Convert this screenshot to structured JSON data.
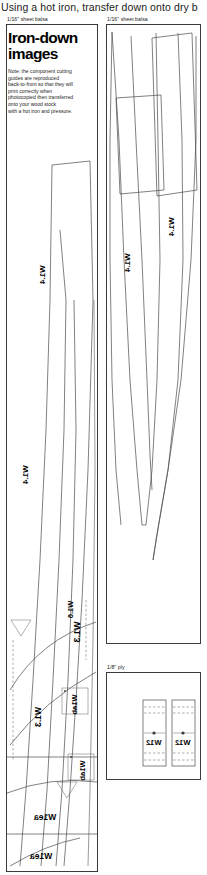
{
  "page": {
    "instruction": "Using a hot iron, transfer down onto dry b",
    "width": 207,
    "height": 875,
    "background": "#ffffff",
    "line_color": "#4a4a4a"
  },
  "title_block": {
    "line1": "Iron-down",
    "line2": "images",
    "note_lines": [
      "Note: the component cutting",
      "guides are reproduced",
      "back-to-front so that they will",
      "print correctly when",
      "photocopied then transferred",
      "onto your wood stock",
      "with a hot iron and pressure."
    ]
  },
  "panels": [
    {
      "id": "panel-left",
      "caption": "1/16\" sheet balsa",
      "material": "1/16\" sheet balsa",
      "x": 6,
      "y": 24,
      "width": 92,
      "height": 848
    },
    {
      "id": "panel-right-top",
      "caption": "1/16\" sheet balsa",
      "material": "1/16\" sheet balsa",
      "x": 106,
      "y": 24,
      "width": 95,
      "height": 620
    },
    {
      "id": "panel-right-bottom",
      "caption": "1/8\" ply",
      "material": "1/8\" ply",
      "x": 106,
      "y": 672,
      "width": 95,
      "height": 108
    }
  ],
  "part_labels": [
    {
      "text": "W1.4",
      "panel": "panel-left",
      "x": 16,
      "y": 470
    },
    {
      "text": "W1.4",
      "panel": "panel-left",
      "x": 33,
      "y": 270
    },
    {
      "text": "W1.6",
      "panel": "panel-left",
      "x": 62,
      "y": 605
    },
    {
      "text": "W1.3",
      "panel": "panel-left",
      "x": 66,
      "y": 619
    },
    {
      "text": "W1.3",
      "panel": "panel-left",
      "x": 32,
      "y": 712
    },
    {
      "text": "W1ea",
      "panel": "panel-left",
      "x": 38,
      "y": 812
    },
    {
      "text": "W1ea",
      "panel": "panel-left",
      "x": 34,
      "y": 851
    },
    {
      "text": "W1ab",
      "panel": "panel-left",
      "x": 70,
      "y": 706
    },
    {
      "text": "W1ab",
      "panel": "panel-left",
      "x": 78,
      "y": 771
    },
    {
      "text": "W1.4",
      "panel": "panel-right-top",
      "x": 123,
      "y": 258
    },
    {
      "text": "W1.4",
      "panel": "panel-right-top",
      "x": 167,
      "y": 222
    },
    {
      "text": "W12",
      "panel": "panel-right-bottom",
      "x": 152,
      "y": 736
    },
    {
      "text": "W12",
      "panel": "panel-right-bottom",
      "x": 176,
      "y": 736
    }
  ],
  "colors": {
    "ink": "#111111",
    "outline": "#4a4a4a",
    "panel_border": "#3b3b3b",
    "hole": "#3a3a3a"
  }
}
